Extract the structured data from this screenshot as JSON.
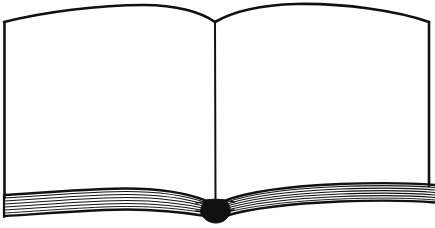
{
  "document": {
    "title": "Open Book",
    "kind": "line-art-illustration",
    "subject": "open book with facing blank pages",
    "style": "black ink outline drawing on white background",
    "alt_text": "Line drawing of an open book seen from above, both pages blank, with a stack of page edges along the bottom converging at a dark spine."
  },
  "canvas": {
    "width": 435,
    "height": 228,
    "background_color": "#ffffff",
    "ink_color": "#111111"
  },
  "parts": [
    {
      "id": "left-page",
      "label": "Left page",
      "fill_color": "#ffffff",
      "outline_color": "#111111",
      "blank": true
    },
    {
      "id": "right-page",
      "label": "Right page",
      "fill_color": "#ffffff",
      "outline_color": "#111111",
      "blank": true
    },
    {
      "id": "spine",
      "label": "Spine fold",
      "outline_color": "#111111"
    },
    {
      "id": "left-page-block",
      "label": "Left page edge stack",
      "leaf_count": 7
    },
    {
      "id": "right-page-block",
      "label": "Right page edge stack",
      "leaf_count": 7
    },
    {
      "id": "spine-base",
      "label": "Spine base wedge",
      "fill_color": "#111111"
    }
  ],
  "geometry": {
    "spine_top_x": 215,
    "spine_top_y": 22,
    "spine_bottom_y": 202,
    "left_outer_x": 4,
    "right_outer_x": 429,
    "top_corner_y": 22,
    "left_top_peak": {
      "x": 150,
      "y": 5
    },
    "right_top_peak": {
      "x": 325,
      "y": 4
    },
    "left_block_low_point": {
      "x": 60,
      "y": 206
    },
    "right_block_low_point": {
      "x": 390,
      "y": 200
    }
  }
}
